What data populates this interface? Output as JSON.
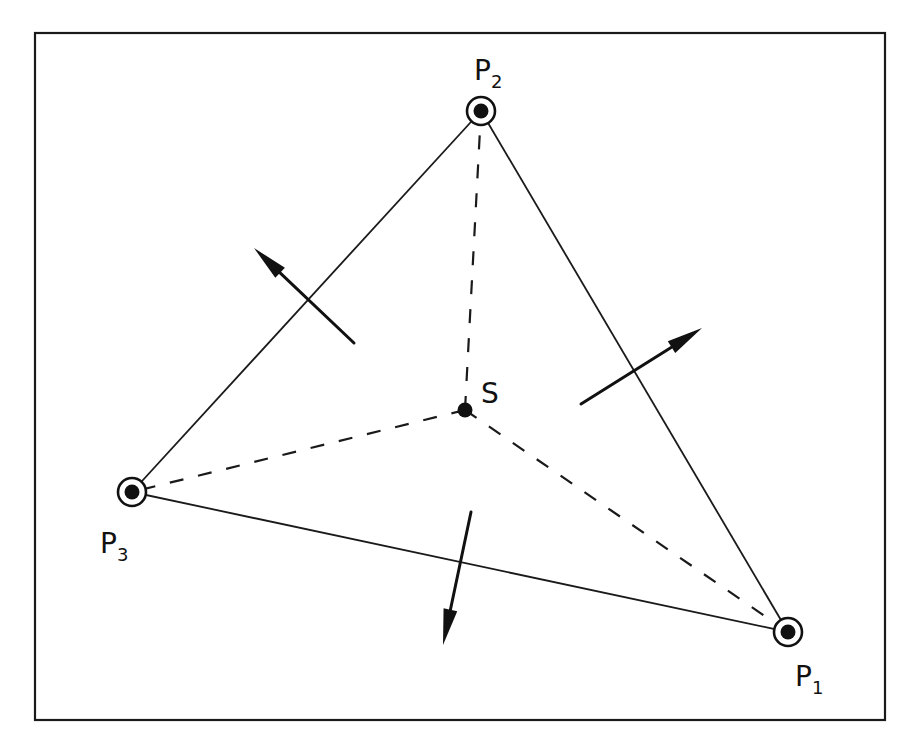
{
  "diagram": {
    "title": "",
    "frame": {
      "x": 35,
      "y": 33,
      "width": 850,
      "height": 687
    },
    "points": [
      {
        "id": "P1",
        "letter": "P",
        "subscript": "1",
        "x": 788,
        "y": 632,
        "label_x": 795,
        "label_y": 686,
        "kind": "ringed"
      },
      {
        "id": "P2",
        "letter": "P",
        "subscript": "2",
        "x": 481,
        "y": 111,
        "label_x": 474,
        "label_y": 80,
        "kind": "ringed"
      },
      {
        "id": "P3",
        "letter": "P",
        "subscript": "3",
        "x": 132,
        "y": 492,
        "label_x": 100,
        "label_y": 553,
        "kind": "ringed"
      },
      {
        "id": "S",
        "letter": "S",
        "subscript": "",
        "x": 465,
        "y": 410,
        "label_x": 481,
        "label_y": 403,
        "kind": "plain"
      }
    ],
    "solid_edges": [
      {
        "from": "P1",
        "to": "P2"
      },
      {
        "from": "P2",
        "to": "P3"
      },
      {
        "from": "P3",
        "to": "P1"
      }
    ],
    "dashed_edges": [
      {
        "from": "S",
        "to": "P1"
      },
      {
        "from": "S",
        "to": "P2"
      },
      {
        "from": "S",
        "to": "P3"
      }
    ],
    "arrows": [
      {
        "name": "normal-arrow-p2p3",
        "x1": 354,
        "y1": 343,
        "x2": 254,
        "y2": 248
      },
      {
        "name": "normal-arrow-p1p2",
        "x1": 581,
        "y1": 404,
        "x2": 702,
        "y2": 328
      },
      {
        "name": "normal-arrow-p3p1",
        "x1": 471,
        "y1": 512,
        "x2": 443,
        "y2": 645
      }
    ],
    "colors": {
      "ink": "#111111",
      "background": "#ffffff"
    }
  }
}
